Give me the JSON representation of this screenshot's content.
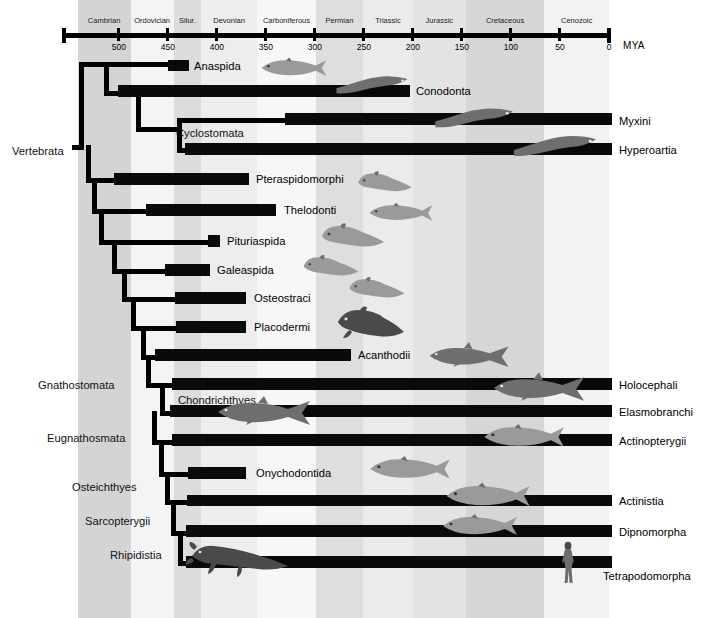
{
  "axis": {
    "unit_label": "MYA",
    "tick_values": [
      "500",
      "450",
      "400",
      "350",
      "300",
      "250",
      "200",
      "150",
      "100",
      "50",
      "0"
    ],
    "range_start_mya": 560,
    "range_end_mya": 0
  },
  "periods": [
    {
      "name": "Cambrian",
      "start_mya": 542,
      "end_mya": 488,
      "shade": "#d4d4d4"
    },
    {
      "name": "Ordovician",
      "start_mya": 488,
      "end_mya": 444,
      "shade": "#f4f4f4"
    },
    {
      "name": "Silur.",
      "start_mya": 444,
      "end_mya": 416,
      "shade": "#dcdcdc"
    },
    {
      "name": "Devonian",
      "start_mya": 416,
      "end_mya": 359,
      "shade": "#ededed"
    },
    {
      "name": "Carboniferous",
      "start_mya": 359,
      "end_mya": 299,
      "shade": "#f7f7f7"
    },
    {
      "name": "Permian",
      "start_mya": 299,
      "end_mya": 251,
      "shade": "#dedede"
    },
    {
      "name": "Triassic",
      "start_mya": 251,
      "end_mya": 200,
      "shade": "#ebebeb"
    },
    {
      "name": "Jurassic",
      "start_mya": 200,
      "end_mya": 146,
      "shade": "#e3e3e3"
    },
    {
      "name": "Cretaceous",
      "start_mya": 146,
      "end_mya": 66,
      "shade": "#d6d6d6"
    },
    {
      "name": "Cenozoic",
      "start_mya": 66,
      "end_mya": 0,
      "shade": "#f2f2f2"
    }
  ],
  "clades": [
    {
      "name": "Vertebrata",
      "x": 12,
      "y": 145
    },
    {
      "name": "Gnathostomata",
      "x": 38,
      "y": 379
    },
    {
      "name": "Eugnathosmata",
      "x": 47,
      "y": 432
    },
    {
      "name": "Osteichthyes",
      "x": 72,
      "y": 481
    },
    {
      "name": "Sarcopterygii",
      "x": 85,
      "y": 515
    },
    {
      "name": "Rhipidistia",
      "x": 110,
      "y": 549
    }
  ],
  "taxa": [
    {
      "name": "Anaspida",
      "bar_x": 168,
      "bar_w": 21,
      "bar_y": 60,
      "bar_h": 11,
      "label_x": 194,
      "label_y": 60,
      "label_side": "right"
    },
    {
      "name": "Conodonta",
      "bar_x": 118,
      "bar_w": 292,
      "bar_y": 85,
      "bar_h": 12,
      "label_x": 416,
      "label_y": 85,
      "label_side": "right"
    },
    {
      "name": "Cyclostomata",
      "bar_x": 0,
      "bar_w": 0,
      "bar_y": 0,
      "bar_h": 0,
      "label_x": 176,
      "label_y": 127,
      "label_side": "clade"
    },
    {
      "name": "Myxini",
      "bar_x": 285,
      "bar_w": 327,
      "bar_y": 113,
      "bar_h": 12,
      "label_x": 619,
      "label_y": 115,
      "label_side": "right"
    },
    {
      "name": "Hyperoartia",
      "bar_x": 185,
      "bar_w": 427,
      "bar_y": 143,
      "bar_h": 12,
      "label_x": 619,
      "label_y": 144,
      "label_side": "right"
    },
    {
      "name": "Pteraspidomorphi",
      "bar_x": 114,
      "bar_w": 135,
      "bar_y": 173,
      "bar_h": 12,
      "label_x": 256,
      "label_y": 173,
      "label_side": "right"
    },
    {
      "name": "Thelodonti",
      "bar_x": 146,
      "bar_w": 130,
      "bar_y": 204,
      "bar_h": 12,
      "label_x": 284,
      "label_y": 204,
      "label_side": "right"
    },
    {
      "name": "Pituriaspida",
      "bar_x": 208,
      "bar_w": 12,
      "bar_y": 235,
      "bar_h": 12,
      "label_x": 227,
      "label_y": 235,
      "label_side": "right"
    },
    {
      "name": "Galeaspida",
      "bar_x": 165,
      "bar_w": 45,
      "bar_y": 264,
      "bar_h": 12,
      "label_x": 217,
      "label_y": 264,
      "label_side": "right"
    },
    {
      "name": "Osteostraci",
      "bar_x": 175,
      "bar_w": 71,
      "bar_y": 292,
      "bar_h": 12,
      "label_x": 254,
      "label_y": 292,
      "label_side": "right"
    },
    {
      "name": "Placodermi",
      "bar_x": 176,
      "bar_w": 70,
      "bar_y": 321,
      "bar_h": 12,
      "label_x": 254,
      "label_y": 321,
      "label_side": "right"
    },
    {
      "name": "Acanthodii",
      "bar_x": 155,
      "bar_w": 196,
      "bar_y": 349,
      "bar_h": 12,
      "label_x": 358,
      "label_y": 349,
      "label_side": "right"
    },
    {
      "name": "Chondrichthyes",
      "bar_x": 0,
      "bar_w": 0,
      "bar_y": 0,
      "bar_h": 0,
      "label_x": 178,
      "label_y": 394,
      "label_side": "clade"
    },
    {
      "name": "Holocephali",
      "bar_x": 172,
      "bar_w": 440,
      "bar_y": 378,
      "bar_h": 12,
      "label_x": 619,
      "label_y": 379,
      "label_side": "right"
    },
    {
      "name": "Elasmobranchi",
      "bar_x": 170,
      "bar_w": 442,
      "bar_y": 405,
      "bar_h": 12,
      "label_x": 619,
      "label_y": 406,
      "label_side": "right"
    },
    {
      "name": "Actinopterygii",
      "bar_x": 172,
      "bar_w": 440,
      "bar_y": 434,
      "bar_h": 12,
      "label_x": 619,
      "label_y": 435,
      "label_side": "right"
    },
    {
      "name": "Onychodontida",
      "bar_x": 188,
      "bar_w": 58,
      "bar_y": 467,
      "bar_h": 12,
      "label_x": 256,
      "label_y": 467,
      "label_side": "right"
    },
    {
      "name": "Actinistia",
      "bar_x": 187,
      "bar_w": 425,
      "bar_y": 495,
      "bar_h": 11,
      "label_x": 619,
      "label_y": 495,
      "label_side": "right"
    },
    {
      "name": "Dipnomorpha",
      "bar_x": 186,
      "bar_w": 426,
      "bar_y": 525,
      "bar_h": 12,
      "label_x": 619,
      "label_y": 526,
      "label_side": "right"
    },
    {
      "name": "Tetrapodomorpha",
      "bar_x": 186,
      "bar_w": 426,
      "bar_y": 556,
      "bar_h": 12,
      "label_x": 603,
      "label_y": 570,
      "label_side": "right"
    }
  ],
  "tree_lines": {
    "h": [
      {
        "x": 72,
        "y": 145,
        "w": 12,
        "h": 5
      },
      {
        "x": 79,
        "y": 62,
        "w": 90,
        "h": 5
      },
      {
        "x": 104,
        "y": 91,
        "w": 16,
        "h": 5
      },
      {
        "x": 136,
        "y": 127,
        "w": 42,
        "h": 5
      },
      {
        "x": 177,
        "y": 118,
        "w": 110,
        "h": 5
      },
      {
        "x": 177,
        "y": 148,
        "w": 10,
        "h": 5
      },
      {
        "x": 86,
        "y": 178,
        "w": 30,
        "h": 5
      },
      {
        "x": 92,
        "y": 209,
        "w": 56,
        "h": 5
      },
      {
        "x": 99,
        "y": 240,
        "w": 111,
        "h": 5
      },
      {
        "x": 112,
        "y": 269,
        "w": 55,
        "h": 5
      },
      {
        "x": 122,
        "y": 297,
        "w": 55,
        "h": 5
      },
      {
        "x": 131,
        "y": 326,
        "w": 47,
        "h": 5
      },
      {
        "x": 141,
        "y": 355,
        "w": 16,
        "h": 5
      },
      {
        "x": 146,
        "y": 383,
        "w": 28,
        "h": 5
      },
      {
        "x": 160,
        "y": 411,
        "w": 12,
        "h": 5
      },
      {
        "x": 152,
        "y": 440,
        "w": 22,
        "h": 5
      },
      {
        "x": 159,
        "y": 472,
        "w": 31,
        "h": 5
      },
      {
        "x": 165,
        "y": 500,
        "w": 24,
        "h": 5
      },
      {
        "x": 171,
        "y": 531,
        "w": 17,
        "h": 5
      },
      {
        "x": 178,
        "y": 561,
        "w": 10,
        "h": 5
      }
    ],
    "v": [
      {
        "x": 79,
        "y": 62,
        "w": 5,
        "h": 88
      },
      {
        "x": 104,
        "y": 62,
        "w": 5,
        "h": 34
      },
      {
        "x": 136,
        "y": 91,
        "w": 5,
        "h": 41
      },
      {
        "x": 177,
        "y": 118,
        "w": 5,
        "h": 35
      },
      {
        "x": 86,
        "y": 145,
        "w": 5,
        "h": 38
      },
      {
        "x": 92,
        "y": 178,
        "w": 5,
        "h": 36
      },
      {
        "x": 99,
        "y": 209,
        "w": 5,
        "h": 36
      },
      {
        "x": 112,
        "y": 240,
        "w": 5,
        "h": 34
      },
      {
        "x": 122,
        "y": 269,
        "w": 5,
        "h": 33
      },
      {
        "x": 131,
        "y": 297,
        "w": 5,
        "h": 34
      },
      {
        "x": 141,
        "y": 326,
        "w": 5,
        "h": 34
      },
      {
        "x": 146,
        "y": 355,
        "w": 5,
        "h": 33
      },
      {
        "x": 160,
        "y": 383,
        "w": 5,
        "h": 33
      },
      {
        "x": 152,
        "y": 411,
        "w": 5,
        "h": 34
      },
      {
        "x": 159,
        "y": 440,
        "w": 5,
        "h": 37
      },
      {
        "x": 165,
        "y": 472,
        "w": 5,
        "h": 33
      },
      {
        "x": 171,
        "y": 500,
        "w": 5,
        "h": 36
      },
      {
        "x": 178,
        "y": 531,
        "w": 5,
        "h": 35
      }
    ]
  },
  "colors": {
    "ink": "#000000",
    "bar": "#0a0a0a",
    "background": "#ffffff"
  }
}
